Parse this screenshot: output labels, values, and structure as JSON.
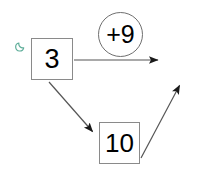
{
  "canvas": {
    "width": 207,
    "height": 174,
    "background_color": "#ffffff"
  },
  "diagram": {
    "type": "node-link-flow",
    "stroke_color": "#555555",
    "box_border_color": "#8a8a8a",
    "circle_border_color": "#6f6f6f",
    "text_color": "#000000",
    "nodes": [
      {
        "id": "node-three",
        "shape": "square",
        "label": "3",
        "x": 31,
        "y": 38,
        "width": 42,
        "height": 42
      },
      {
        "id": "node-ten",
        "shape": "square",
        "label": "10",
        "x": 99,
        "y": 122,
        "width": 41,
        "height": 42
      },
      {
        "id": "badge-plus-nine",
        "shape": "circle",
        "label": "+9",
        "x": 98,
        "y": 12,
        "width": 45,
        "height": 45
      }
    ],
    "icons": [
      {
        "id": "moon-icon",
        "name": "crescent-moon-icon",
        "color": "#5fae9a",
        "x": 15,
        "y": 38,
        "size": 12
      }
    ],
    "arrows": [
      {
        "id": "arrow-three-right",
        "from": "node-three",
        "to": "edge-right",
        "x1": 74,
        "y1": 60,
        "x2": 162,
        "y2": 60,
        "direction": "right"
      },
      {
        "id": "arrow-three-to-ten",
        "from": "node-three",
        "to": "node-ten",
        "x1": 49,
        "y1": 82,
        "x2": 96,
        "y2": 135,
        "direction": "down-right"
      },
      {
        "id": "arrow-ten-up-right",
        "from": "node-ten",
        "to": "edge-upper-right",
        "x1": 141,
        "y1": 158,
        "x2": 183,
        "y2": 80,
        "direction": "up-right"
      }
    ]
  }
}
